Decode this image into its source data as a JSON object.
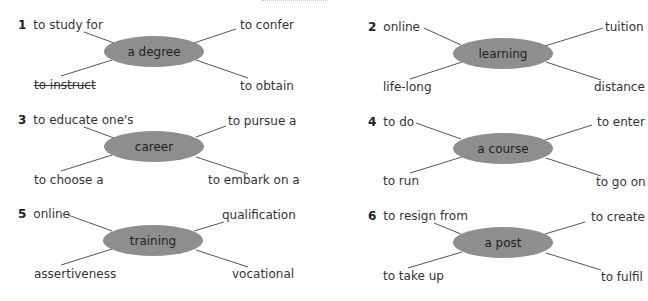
{
  "exercise": {
    "groups": [
      {
        "number": "1",
        "center": "a degree",
        "top_left": "to study for",
        "top_right": "to confer",
        "bottom_left": "to instruct",
        "bottom_right": "to obtain",
        "bottom_left_struck": true
      },
      {
        "number": "2",
        "center": "learning",
        "top_left": "online",
        "top_right": "tuition",
        "bottom_left": "life-long",
        "bottom_right": "distance"
      },
      {
        "number": "3",
        "center": "career",
        "top_left": "to educate one's",
        "top_right": "to pursue a",
        "bottom_left": "to choose a",
        "bottom_right": "to embark on a"
      },
      {
        "number": "4",
        "center": "a course",
        "top_left": "to do",
        "top_right": "to enter",
        "bottom_left": "to run",
        "bottom_right": "to go on"
      },
      {
        "number": "5",
        "center": "training",
        "top_left": "online",
        "top_right": "qualification",
        "bottom_left": "assertiveness",
        "bottom_right": "vocational"
      },
      {
        "number": "6",
        "center": "a post",
        "top_left": "to resign from",
        "top_right": "to create",
        "bottom_left": "to take up",
        "bottom_right": "to fulfil"
      }
    ]
  },
  "colors": {
    "oval_fill": "#8e8e8e",
    "line": "#555555",
    "text": "#333333"
  }
}
